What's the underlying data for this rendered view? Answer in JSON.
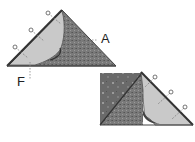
{
  "diagram": {
    "type": "quilting-steps",
    "labels": {
      "a": "A",
      "f": "F"
    },
    "colors": {
      "dark_fabric": "#6e6e6e",
      "light_fabric": "#c8c8c8",
      "outline": "#333333",
      "pin": "#555555",
      "dashed_line": "#888888"
    },
    "steps": [
      {
        "id": "step-1",
        "shape": "triangle with folded flap",
        "pins": 3
      },
      {
        "id": "step-2",
        "shape": "square with triangle flap",
        "pins": 3
      }
    ]
  }
}
